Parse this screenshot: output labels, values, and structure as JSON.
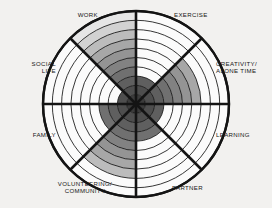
{
  "background_color": "#f2f1ef",
  "stroke_color": "#141414",
  "labels": {
    "work": "WORK",
    "exercise": "EXERCISE",
    "creativity_line1": "CREATIVITY/",
    "creativity_line2": "ALONE TIME",
    "learning": "LEARNING",
    "partner": "PARTNER",
    "volunteering_line1": "VOLUNTEERING/",
    "volunteering_line2": "COMMUNITY",
    "family": "FAMILY",
    "social_line1": "SOCIAL",
    "social_line2": "LIFE"
  },
  "chart_data": {
    "type": "pie",
    "xlabel": "",
    "ylabel": "",
    "rings": 10,
    "grid": true,
    "legend_position": "around-perimeter",
    "radius_px": 93,
    "center": [
      136,
      104
    ],
    "categories": [
      "EXERCISE",
      "CREATIVITY/ALONE TIME",
      "LEARNING",
      "PARTNER",
      "VOLUNTEERING/COMMUNITY",
      "FAMILY",
      "SOCIAL LIFE",
      "WORK"
    ],
    "values": [
      3,
      7,
      3,
      4,
      8,
      4,
      2,
      10
    ],
    "ymax": 10,
    "sectors": [
      {
        "name": "EXERCISE",
        "start_deg": -90,
        "end_deg": -45,
        "filled_rings": 3,
        "label_x": 174,
        "label_y": 17,
        "anchor": "start",
        "lines": 1
      },
      {
        "name": "CREATIVITY/ALONE TIME",
        "start_deg": -45,
        "end_deg": 0,
        "filled_rings": 7,
        "label_x": 216,
        "label_y": 66,
        "anchor": "start",
        "lines": 2
      },
      {
        "name": "LEARNING",
        "start_deg": 0,
        "end_deg": 45,
        "filled_rings": 3,
        "label_x": 216,
        "label_y": 137,
        "anchor": "start",
        "lines": 1
      },
      {
        "name": "PARTNER",
        "start_deg": 45,
        "end_deg": 90,
        "filled_rings": 4,
        "label_x": 172,
        "label_y": 190,
        "anchor": "start",
        "lines": 1
      },
      {
        "name": "VOLUNTEERING/COMMUNITY",
        "start_deg": 90,
        "end_deg": 135,
        "filled_rings": 8,
        "label_x": 85,
        "label_y": 186,
        "anchor": "middle",
        "lines": 2
      },
      {
        "name": "FAMILY",
        "start_deg": 135,
        "end_deg": 180,
        "filled_rings": 4,
        "label_x": 56,
        "label_y": 137,
        "anchor": "end",
        "lines": 1
      },
      {
        "name": "SOCIAL LIFE",
        "start_deg": 180,
        "end_deg": 225,
        "filled_rings": 2,
        "label_x": 56,
        "label_y": 66,
        "anchor": "end",
        "lines": 2
      },
      {
        "name": "WORK",
        "start_deg": 225,
        "end_deg": 270,
        "filled_rings": 10,
        "label_x": 98,
        "label_y": 17,
        "anchor": "end",
        "lines": 1
      }
    ],
    "ring_shades": [
      "#3b3b3b",
      "#4e4e4e",
      "#5f5f5f",
      "#707070",
      "#828282",
      "#949494",
      "#a7a7a7",
      "#bcbcbc",
      "#d2d2d2",
      "#e6e6e6"
    ],
    "empty_shade": "#fbfbfb"
  }
}
